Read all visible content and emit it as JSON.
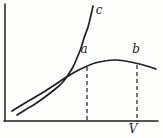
{
  "window": {
    "width_px": 163,
    "height_px": 138,
    "background": "#fdfdfb"
  },
  "chart_data": {
    "type": "line",
    "title": "",
    "xlabel": "V",
    "ylabel": "",
    "grid": false,
    "numeric_axes": false,
    "legend": "none",
    "stroke_color": "#1f1f1f",
    "background": "#fdfdfb",
    "canvas_px": {
      "width": 163,
      "height": 138
    },
    "axes_px": {
      "origin_x": 5,
      "origin_y": 121,
      "x_end": 158,
      "y_top": 4,
      "stroke_width": 1.5
    },
    "series": [
      {
        "name": "c",
        "label": "c",
        "stroke_width": 1.7,
        "points_px": [
          [
            17,
            115
          ],
          [
            25,
            110
          ],
          [
            35,
            104
          ],
          [
            45,
            97
          ],
          [
            54,
            90
          ],
          [
            62,
            83
          ],
          [
            68,
            75
          ],
          [
            73,
            67
          ],
          [
            77,
            58
          ],
          [
            81,
            48
          ],
          [
            84,
            38
          ],
          [
            88,
            27
          ],
          [
            91,
            15
          ],
          [
            93,
            6
          ]
        ]
      },
      {
        "name": "ab",
        "label": "",
        "stroke_width": 1.7,
        "points_px": [
          [
            12,
            111
          ],
          [
            20,
            106
          ],
          [
            30,
            100
          ],
          [
            42,
            93
          ],
          [
            53,
            86
          ],
          [
            65,
            78
          ],
          [
            75,
            72
          ],
          [
            85,
            67
          ],
          [
            95,
            63
          ],
          [
            105,
            61
          ],
          [
            115,
            60
          ],
          [
            125,
            61
          ],
          [
            135,
            63
          ],
          [
            145,
            65.5
          ],
          [
            156,
            69
          ]
        ]
      }
    ],
    "droplines_px": [
      {
        "name": "a",
        "x": 87,
        "y_top": 67,
        "y_bottom": 122,
        "dash": "4 3",
        "stroke_width": 1.2
      },
      {
        "name": "b",
        "x": 137,
        "y_top": 65,
        "y_bottom": 122,
        "dash": "4 3",
        "stroke_width": 1.2
      }
    ],
    "labels": [
      {
        "name": "curve-c-label",
        "text": "c",
        "x": 99,
        "y": 14,
        "font_size": 12
      },
      {
        "name": "point-a-label",
        "text": "a",
        "x": 84,
        "y": 53,
        "font_size": 12
      },
      {
        "name": "point-b-label",
        "text": "b",
        "x": 136,
        "y": 53,
        "font_size": 12
      },
      {
        "name": "x-axis-label",
        "text": "V",
        "x": 133,
        "y": 133,
        "font_size": 12
      }
    ]
  }
}
